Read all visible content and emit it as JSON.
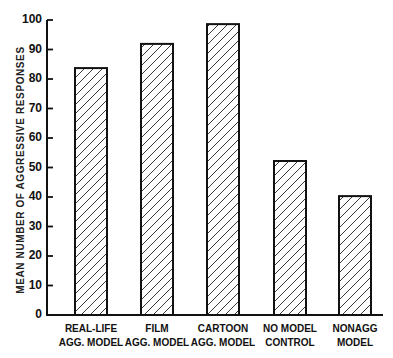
{
  "chart_data": {
    "type": "bar",
    "title": "",
    "xlabel": "",
    "ylabel": "MEAN NUMBER OF AGGRESSIVE RESPONSES",
    "ylim": [
      0,
      100
    ],
    "yticks": [
      0,
      10,
      20,
      30,
      40,
      50,
      60,
      70,
      80,
      90,
      100
    ],
    "grid": false,
    "legend": null,
    "bar_fill": "diagonal hatch",
    "categories": [
      "REAL-LIFE\nAGG. MODEL",
      "FILM\nAGG. MODEL",
      "CARTOON\nAGG. MODEL",
      "NO MODEL\nCONTROL",
      "NONAGG\nMODEL"
    ],
    "values": [
      83.7,
      91.9,
      98.6,
      52.2,
      40.3
    ]
  },
  "layout": {
    "plot_left": 47,
    "plot_right": 383,
    "y_zero_px": 315,
    "y_max_px": 20,
    "bar_width": 32,
    "bar_lefts": [
      75,
      141,
      207,
      274,
      339
    ],
    "colors": {
      "ink": "#111111",
      "background": "#ffffff"
    }
  }
}
